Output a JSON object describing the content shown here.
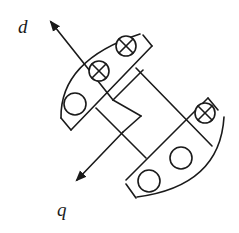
{
  "diagram": {
    "axes": [
      {
        "name": "d",
        "label": "d",
        "direction": "up-left"
      },
      {
        "name": "q",
        "label": "q",
        "direction": "down-left"
      }
    ],
    "upper_pole": {
      "conductors": [
        {
          "type": "cross",
          "symbol": "⊗"
        },
        {
          "type": "cross",
          "symbol": "⊗"
        },
        {
          "type": "dot",
          "symbol": "○"
        }
      ]
    },
    "lower_pole": {
      "conductors": [
        {
          "type": "cross",
          "symbol": "⊗"
        },
        {
          "type": "dot",
          "symbol": "○"
        },
        {
          "type": "dot",
          "symbol": "○"
        }
      ]
    },
    "colors": {
      "stroke": "#1a1a1a",
      "background": "#ffffff"
    }
  }
}
